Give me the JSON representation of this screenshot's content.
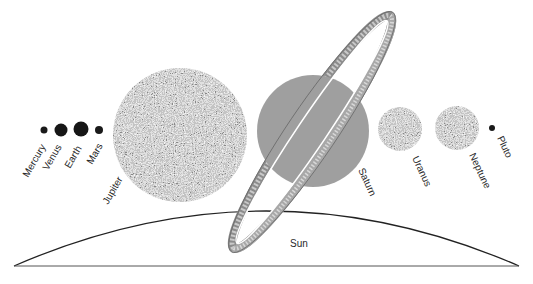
{
  "diagram": {
    "colors": {
      "background": "#ffffff",
      "outline": "#222222",
      "planet_dark": "#3a3a3a",
      "planet_light": "#bdbdbd",
      "label": "#2a2a2a"
    },
    "planets": [
      {
        "name": "Mercury",
        "cx": 44,
        "cy": 130,
        "r": 3.5,
        "style": "solid"
      },
      {
        "name": "Venus",
        "cx": 61,
        "cy": 130,
        "r": 6.5,
        "style": "solid"
      },
      {
        "name": "Earth",
        "cx": 81,
        "cy": 129,
        "r": 7.5,
        "style": "solid"
      },
      {
        "name": "Mars",
        "cx": 99,
        "cy": 130,
        "r": 4,
        "style": "solid"
      },
      {
        "name": "Jupiter",
        "cx": 180,
        "cy": 135,
        "r": 67,
        "style": "speckled"
      },
      {
        "name": "Saturn",
        "cx": 313,
        "cy": 131,
        "r": 56,
        "style": "speckled-dark"
      },
      {
        "name": "Uranus",
        "cx": 400,
        "cy": 129,
        "r": 22,
        "style": "speckled"
      },
      {
        "name": "Neptune",
        "cx": 457,
        "cy": 128,
        "r": 22,
        "style": "speckled"
      },
      {
        "name": "Pluto",
        "cx": 492,
        "cy": 128,
        "r": 3,
        "style": "solid"
      }
    ],
    "labels": {
      "mercury": "Mercury",
      "venus": "Venus",
      "earth": "Earth",
      "mars": "Mars",
      "jupiter": "Jupiter",
      "saturn": "Saturn",
      "uranus": "Uranus",
      "neptune": "Neptune",
      "pluto": "Pluto",
      "sun": "Sun"
    },
    "sun": {
      "left_x": 14,
      "right_x": 519,
      "base_y": 266,
      "top_y": 211
    },
    "saturn_ring": {
      "cx": 312,
      "cy": 132,
      "rx": 140,
      "ry": 20,
      "angle": -56
    }
  }
}
